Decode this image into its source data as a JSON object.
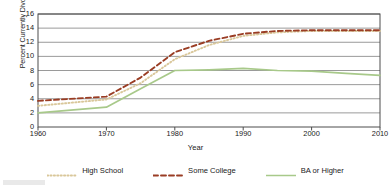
{
  "chart_data": {
    "type": "line",
    "title": "",
    "xlabel": "Year",
    "ylabel": "Percent Currently Divorced",
    "xlim": [
      1960,
      2010
    ],
    "ylim": [
      0,
      16
    ],
    "xticks": [
      1960,
      1970,
      1980,
      1990,
      2000,
      2010
    ],
    "yticks": [
      0,
      2,
      4,
      6,
      8,
      10,
      12,
      14,
      16
    ],
    "grid": "horizontal",
    "legend_position": "bottom",
    "x": [
      1960,
      1970,
      1975,
      1980,
      1985,
      1990,
      1995,
      2000,
      2005,
      2010
    ],
    "series": [
      {
        "name": "High School",
        "style": "dotted",
        "color": "#d9c79a",
        "values": [
          3.0,
          3.9,
          6.2,
          9.6,
          11.6,
          12.9,
          13.4,
          13.6,
          13.6,
          13.6
        ]
      },
      {
        "name": "Some College",
        "style": "dashed",
        "color": "#9a3d24",
        "values": [
          3.7,
          4.3,
          7.0,
          10.6,
          12.2,
          13.2,
          13.6,
          13.7,
          13.7,
          13.7
        ]
      },
      {
        "name": "BA or Higher",
        "style": "solid",
        "color": "#a8c98a",
        "values": [
          2.0,
          2.8,
          5.4,
          8.0,
          8.1,
          8.3,
          8.0,
          7.9,
          7.6,
          7.3
        ]
      }
    ]
  },
  "axes": {
    "ylabel": "Percent Currently Divorced",
    "xlabel": "Year",
    "yticks": [
      "16",
      "14",
      "12",
      "10",
      "8",
      "6",
      "4",
      "2",
      "0"
    ],
    "xticks": [
      "1960",
      "1970",
      "1980",
      "1990",
      "2000",
      "2010"
    ]
  },
  "legend": {
    "items": [
      {
        "label": "High School",
        "icon": "dotted-line-swatch",
        "color": "#d9c79a"
      },
      {
        "label": "Some College",
        "icon": "dashed-line-swatch",
        "color": "#9a3d24"
      },
      {
        "label": "BA or Higher",
        "icon": "solid-line-swatch",
        "color": "#a8c98a"
      }
    ]
  },
  "colors": {
    "high_school": "#d9c79a",
    "some_college": "#9a3d24",
    "ba_or_higher": "#a8c98a",
    "grid": "#808080",
    "axis": "#4d4d4d",
    "text": "#1a1a1a",
    "background": "#ffffff"
  }
}
